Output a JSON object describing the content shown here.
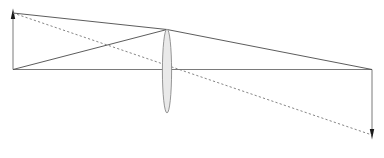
{
  "figure": {
    "width": 384,
    "height": 158,
    "background_color": "#ffffff"
  },
  "colors": {
    "ray_solid": "#4a4a4a",
    "ray_dashed": "#777777",
    "axis": "#6b6b6b",
    "lens_fill": "#e9e9e9",
    "lens_stroke": "#8a8a8a",
    "object_line": "#6b6b6b",
    "image_line": "#6b6b6b",
    "arrowhead": "#1a1a1a"
  },
  "optical_axis": {
    "label": "optical axis",
    "x_start": 13,
    "x_end": 372,
    "y": 69.5,
    "stroke_width": 0.9
  },
  "lens": {
    "label": "converging lens",
    "center_x": 167,
    "center_y": 70,
    "top_y": 29,
    "bottom_y": 113,
    "half_width": 4.6,
    "stroke_width": 0.9
  },
  "object": {
    "label": "object arrow",
    "x": 13,
    "base_y": 69.5,
    "tip_y": 13,
    "direction": "up",
    "stroke_width": 0.9
  },
  "image": {
    "label": "image arrow",
    "x": 372,
    "base_y": 69.5,
    "tip_y": 135,
    "direction": "down",
    "stroke_width": 0.9
  },
  "rays": [
    {
      "id": "ray-object-tip-to-lens",
      "label": "ray from object tip to lens top",
      "style": "solid",
      "points": [
        [
          13,
          13
        ],
        [
          167,
          29.5
        ]
      ]
    },
    {
      "id": "ray-object-base-to-lens",
      "label": "ray from object base to lens top",
      "style": "solid",
      "points": [
        [
          13,
          69.5
        ],
        [
          167,
          29.5
        ]
      ]
    },
    {
      "id": "ray-lens-to-image",
      "label": "refracted ray from lens top to image base",
      "style": "solid",
      "points": [
        [
          167,
          29.5
        ],
        [
          372,
          69.5
        ]
      ]
    },
    {
      "id": "ray-chief-dashed",
      "label": "chief ray through lens center to image tip",
      "style": "dashed",
      "points": [
        [
          13,
          13
        ],
        [
          372,
          135
        ]
      ]
    }
  ],
  "arrowheads": [
    {
      "id": "object-arrowhead",
      "label": "object tip arrowhead",
      "x": 13,
      "y": 13,
      "direction": "up"
    },
    {
      "id": "image-arrowhead",
      "label": "image tip arrowhead",
      "x": 372,
      "y": 135,
      "direction": "down"
    }
  ],
  "chart_data": {
    "type": "diagram",
    "xlabel": "",
    "ylabel": "",
    "xlim": [
      0,
      384
    ],
    "ylim": [
      0,
      158
    ],
    "grid": false,
    "legend": "none",
    "elements": [
      {
        "name": "object",
        "x": 13,
        "y_base": 69.5,
        "y_tip": 13,
        "height": 56.5,
        "orientation": "upright"
      },
      {
        "name": "lens",
        "x": 167,
        "aperture_top": 29,
        "aperture_bottom": 113,
        "thickness": 9.2,
        "type": "converging"
      },
      {
        "name": "image",
        "x": 372,
        "y_base": 69.5,
        "y_tip": 135,
        "height": 65.5,
        "orientation": "inverted"
      },
      {
        "name": "optical_axis",
        "x0": 13,
        "x1": 372,
        "y": 69.5
      }
    ],
    "series": [
      {
        "name": "ray-object-tip-to-lens",
        "style": "solid",
        "x": [
          13,
          167
        ],
        "y": [
          13,
          29.5
        ]
      },
      {
        "name": "ray-object-base-to-lens",
        "style": "solid",
        "x": [
          13,
          167
        ],
        "y": [
          69.5,
          29.5
        ]
      },
      {
        "name": "ray-lens-to-image",
        "style": "solid",
        "x": [
          167,
          372
        ],
        "y": [
          29.5,
          69.5
        ]
      },
      {
        "name": "ray-chief-dashed",
        "style": "dashed",
        "x": [
          13,
          372
        ],
        "y": [
          13,
          135
        ]
      }
    ]
  }
}
